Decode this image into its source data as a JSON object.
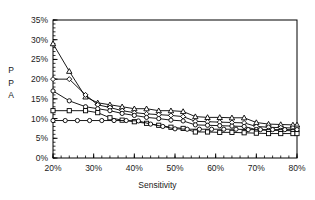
{
  "chart_data": {
    "type": "line",
    "title": "",
    "xlabel": "Sensitivity",
    "ylabel": "PPA",
    "ylabel_lines": [
      "P",
      "P",
      "A"
    ],
    "xlim": [
      20,
      80
    ],
    "ylim": [
      0,
      35
    ],
    "xticks": [
      "20%",
      "30%",
      "40%",
      "50%",
      "60%",
      "70%",
      "80%"
    ],
    "xtick_values": [
      20,
      30,
      40,
      50,
      60,
      70,
      80
    ],
    "yticks": [
      "0%",
      "5%",
      "10%",
      "15%",
      "20%",
      "25%",
      "30%",
      "35%"
    ],
    "ytick_values": [
      0,
      5,
      10,
      15,
      20,
      25,
      30,
      35
    ],
    "grid": false,
    "legend_position": "none",
    "minor_tick_interval_x": 2,
    "minor_tick_interval_y": 1,
    "axis_color": "#000000",
    "line_color": "#000000",
    "background": "#ffffff",
    "series": [
      {
        "name": "Series 1",
        "marker": "triangle",
        "x": [
          20,
          24,
          28,
          31,
          34,
          37,
          40,
          43,
          46,
          49,
          52,
          55,
          58,
          61,
          64,
          67,
          70,
          73,
          76,
          79,
          80
        ],
        "values": [
          29.0,
          22.0,
          15.5,
          14.0,
          13.5,
          13.0,
          12.5,
          12.5,
          12.0,
          12.0,
          11.8,
          10.5,
          10.3,
          10.3,
          10.2,
          10.2,
          9.0,
          8.6,
          8.5,
          8.4,
          8.4
        ]
      },
      {
        "name": "Series 2",
        "marker": "diamond",
        "x": [
          20,
          24,
          28,
          31,
          34,
          37,
          40,
          43,
          46,
          49,
          52,
          55,
          58,
          61,
          64,
          67,
          70,
          73,
          76,
          79,
          80
        ],
        "values": [
          20.0,
          20.0,
          16.0,
          13.5,
          12.8,
          12.0,
          11.5,
          11.2,
          11.0,
          10.8,
          10.5,
          9.3,
          9.2,
          9.1,
          9.0,
          8.9,
          8.0,
          7.8,
          7.7,
          7.6,
          7.6
        ]
      },
      {
        "name": "Series 3",
        "marker": "circle",
        "x": [
          20,
          24,
          28,
          31,
          34,
          37,
          40,
          43,
          46,
          49,
          52,
          55,
          58,
          61,
          64,
          67,
          70,
          73,
          76,
          79,
          80
        ],
        "values": [
          17.0,
          14.5,
          13.0,
          12.5,
          12.0,
          11.3,
          10.8,
          10.3,
          10.0,
          9.6,
          9.4,
          8.4,
          8.3,
          8.2,
          8.1,
          8.0,
          7.2,
          7.0,
          7.0,
          6.9,
          6.9
        ]
      },
      {
        "name": "Series 4",
        "marker": "square",
        "x": [
          20,
          24,
          28,
          31,
          34,
          37,
          40,
          43,
          46,
          49,
          52,
          55,
          58,
          61,
          64,
          67,
          70,
          73,
          76,
          79,
          80
        ],
        "values": [
          12.0,
          12.0,
          12.0,
          11.5,
          10.2,
          9.6,
          9.2,
          8.8,
          8.3,
          7.8,
          7.5,
          6.6,
          6.6,
          6.5,
          6.5,
          6.4,
          6.3,
          6.2,
          6.2,
          6.2,
          6.2
        ]
      },
      {
        "name": "Series 5",
        "marker": "circle",
        "x": [
          20,
          23,
          26,
          29,
          32,
          35,
          38,
          41,
          44,
          47,
          50,
          53,
          56,
          59,
          62,
          65,
          68,
          71,
          74,
          77,
          80
        ],
        "values": [
          9.5,
          9.5,
          9.5,
          9.5,
          9.5,
          9.5,
          9.5,
          9.4,
          8.6,
          8.0,
          7.4,
          7.3,
          7.3,
          7.3,
          7.3,
          7.3,
          7.2,
          7.2,
          7.2,
          7.2,
          7.2
        ]
      }
    ]
  }
}
